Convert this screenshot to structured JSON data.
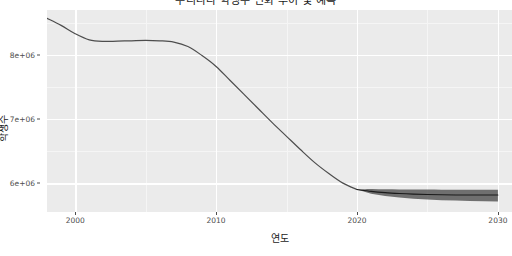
{
  "chart_data": {
    "type": "line",
    "title": "우리나라 학생수 변화 추이 및 예측",
    "xlabel": "연도",
    "ylabel": "학생수",
    "xlim": [
      1998,
      2031
    ],
    "ylim": [
      5550000,
      8700000
    ],
    "grid": true,
    "legend": "none",
    "xticks": [
      2000,
      2010,
      2020,
      2030
    ],
    "xtick_labels": [
      "2000",
      "2010",
      "2020",
      "2030"
    ],
    "yticks": [
      6000000,
      7000000,
      8000000
    ],
    "ytick_labels": [
      "6e+06",
      "7e+06",
      "8e+06"
    ],
    "x_minor_ticks": [
      2005,
      2015,
      2025
    ],
    "y_minor_ticks": [
      5500000,
      6500000,
      7500000,
      8500000
    ],
    "panel_background": "#ebebeb",
    "grid_major_color": "#ffffff",
    "grid_minor_color": "#f5f5f5",
    "series": [
      {
        "name": "관측값",
        "type": "line",
        "color": "#4d4d4d",
        "linewidth": 1.2,
        "x": [
          1998,
          1999,
          2000,
          2001,
          2002,
          2003,
          2004,
          2005,
          2006,
          2007,
          2008,
          2009,
          2010,
          2011,
          2012,
          2013,
          2014,
          2015,
          2016,
          2017,
          2018,
          2019,
          2020
        ],
        "values": [
          8570000,
          8460000,
          8330000,
          8235000,
          8210000,
          8215000,
          8220000,
          8225000,
          8220000,
          8200000,
          8130000,
          7990000,
          7820000,
          7600000,
          7380000,
          7160000,
          6940000,
          6730000,
          6520000,
          6320000,
          6150000,
          6000000,
          5900000
        ]
      },
      {
        "name": "예측값",
        "type": "line",
        "color": "#1a1a1a",
        "linewidth": 1.1,
        "x": [
          2020,
          2021,
          2022,
          2023,
          2024,
          2025,
          2026,
          2027,
          2028,
          2029,
          2030
        ],
        "values": [
          5900000,
          5872000,
          5852000,
          5838000,
          5828000,
          5822000,
          5818000,
          5816000,
          5815000,
          5814000,
          5814000
        ]
      }
    ],
    "forecast_band": {
      "name": "예측 신뢰구간",
      "color": "#595959",
      "opacity": 0.85,
      "x": [
        2020,
        2021,
        2022,
        2023,
        2024,
        2025,
        2026,
        2027,
        2028,
        2029,
        2030
      ],
      "lower": [
        5900000,
        5835000,
        5800000,
        5775000,
        5758000,
        5745000,
        5735000,
        5728000,
        5722000,
        5718000,
        5715000
      ],
      "upper": [
        5900000,
        5910000,
        5905000,
        5902000,
        5900000,
        5899000,
        5898000,
        5898000,
        5898000,
        5898000,
        5898000
      ]
    }
  }
}
